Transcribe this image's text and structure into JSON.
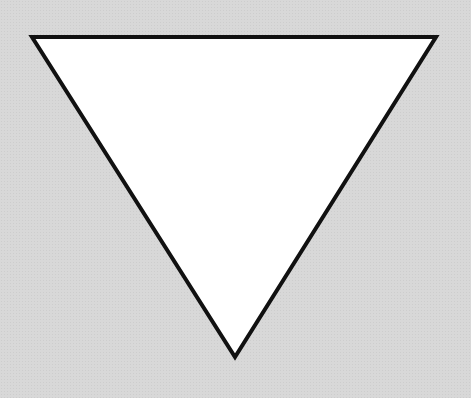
{
  "shape": {
    "type": "inverted-triangle",
    "points": [
      [
        32,
        37
      ],
      [
        436,
        37
      ],
      [
        235,
        357
      ]
    ],
    "fill": "#ffffff",
    "stroke": "#111111",
    "stroke_width": 4
  },
  "background": {
    "color": "#d8d8d8"
  }
}
